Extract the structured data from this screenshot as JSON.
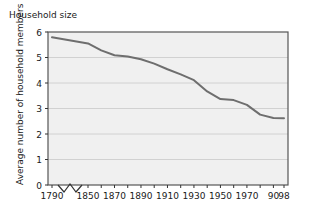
{
  "chart": {
    "title": "Household size",
    "y_axis_title": "Average number of household members"
  },
  "chart_data": {
    "type": "line",
    "title": "Household size",
    "xlabel": "",
    "ylabel": "Average number of household members",
    "xlim": [
      1790,
      1998
    ],
    "ylim": [
      0,
      6
    ],
    "grid": true,
    "legend": false,
    "axis_break": {
      "present": true,
      "between": [
        1790,
        1850
      ],
      "style": "zigzag"
    },
    "y_ticks": [
      0,
      1,
      2,
      3,
      4,
      5,
      6
    ],
    "y_tick_labels": [
      "0",
      "1",
      "2",
      "3",
      "4",
      "5",
      "6"
    ],
    "x_ticks": [
      1790,
      1850,
      1860,
      1870,
      1880,
      1890,
      1900,
      1910,
      1920,
      1930,
      1940,
      1950,
      1960,
      1970,
      1980,
      1990,
      1998
    ],
    "x_tick_labels": [
      "1790",
      "1850",
      "",
      "1870",
      "",
      "1890",
      "",
      "1910",
      "",
      "1930",
      "",
      "1950",
      "",
      "1970",
      "",
      "90",
      "98"
    ],
    "line_color": "#6e6e6e",
    "plot_background": "#f0f0f0",
    "series": [
      {
        "name": "Average household size",
        "x": [
          1790,
          1850,
          1860,
          1870,
          1880,
          1890,
          1900,
          1910,
          1920,
          1930,
          1940,
          1950,
          1960,
          1970,
          1980,
          1990,
          1998
        ],
        "values": [
          5.79,
          5.55,
          5.28,
          5.09,
          5.04,
          4.93,
          4.76,
          4.54,
          4.34,
          4.11,
          3.67,
          3.37,
          3.33,
          3.14,
          2.76,
          2.63,
          2.62
        ]
      }
    ]
  }
}
